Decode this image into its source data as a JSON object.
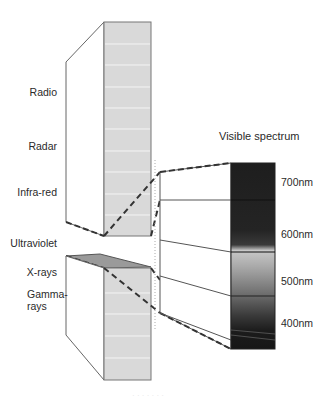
{
  "diagram": {
    "em_bands": [
      {
        "label": "Radio"
      },
      {
        "label": "Radar"
      },
      {
        "label": "Infra-red"
      },
      {
        "label": "Ultraviolet"
      },
      {
        "label": "X-rays"
      },
      {
        "label": "Gamma-\nrays",
        "line1": "Gamma-",
        "line2": "rays"
      }
    ],
    "visible": {
      "title": "Visible spectrum",
      "ticks": [
        {
          "label": "700nm"
        },
        {
          "label": "600nm"
        },
        {
          "label": "500nm"
        },
        {
          "label": "400nm"
        }
      ]
    },
    "colors": {
      "prism_face": "#d9d9d9",
      "slab": "#9a9a9a",
      "outline": "#555555",
      "spectrum_dark": "#1c1c1c",
      "spectrum_light": "#bdbdbd"
    },
    "caption": "· · · · · · ·"
  }
}
